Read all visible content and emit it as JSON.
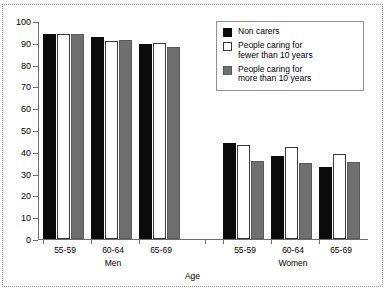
{
  "chart_data": {
    "type": "bar",
    "title": "",
    "xlabel": "Age",
    "ylabel": "",
    "ylim": [
      0,
      100
    ],
    "yticks": [
      0,
      10,
      20,
      30,
      40,
      50,
      60,
      70,
      80,
      90,
      100
    ],
    "grid": false,
    "legend_position": "top-right",
    "panels": [
      "Men",
      "Women"
    ],
    "categories": [
      "55-59",
      "60-64",
      "65-69"
    ],
    "series": [
      {
        "name": "Non carers",
        "color": "#0b0b0b",
        "values_men": [
          94,
          92.5,
          89.5
        ],
        "values_women": [
          44,
          38,
          33
        ]
      },
      {
        "name": "People caring for fewer than 10 years",
        "color": "#ffffff",
        "values_men": [
          94,
          91,
          90
        ],
        "values_women": [
          43,
          42,
          39
        ]
      },
      {
        "name": "People caring for more than 10 years",
        "color": "#6f6f6f",
        "values_men": [
          94,
          91.5,
          88
        ],
        "values_women": [
          36,
          35,
          35.5
        ]
      }
    ]
  },
  "axis": {
    "y_tick_labels": [
      "0",
      "10",
      "20",
      "30",
      "40",
      "50",
      "60",
      "70",
      "80",
      "90",
      "100"
    ],
    "x_label": "Age",
    "group_labels_men": [
      "55-59",
      "60-64",
      "65-69"
    ],
    "group_labels_women": [
      "55-59",
      "60-64",
      "65-69"
    ],
    "panel_label_men": "Men",
    "panel_label_women": "Women"
  },
  "legend": {
    "items": [
      {
        "label": "Non carers",
        "color": "#0b0b0b"
      },
      {
        "label": "People caring for\nfewer than 10 years",
        "color": "#ffffff"
      },
      {
        "label": "People caring for\nmore than 10 years",
        "color": "#6f6f6f"
      }
    ]
  }
}
